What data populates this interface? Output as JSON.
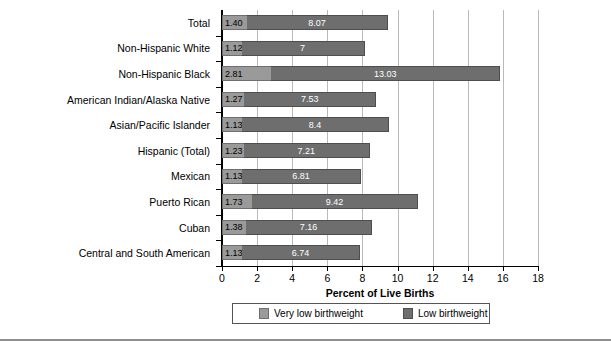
{
  "chart_data": {
    "type": "bar",
    "orientation": "horizontal",
    "stacked": true,
    "title": "",
    "xlabel": "Percent of Live Births",
    "ylabel": "",
    "xlim": [
      0,
      18
    ],
    "xticks": [
      0,
      2,
      4,
      6,
      8,
      10,
      12,
      14,
      16,
      18
    ],
    "grid": "vertical",
    "legend_position": "bottom",
    "categories": [
      "Total",
      "Non-Hispanic White",
      "Non-Hispanic Black",
      "American Indian/Alaska Native",
      "Asian/Pacific Islander",
      "Hispanic (Total)",
      "Mexican",
      "Puerto Rican",
      "Cuban",
      "Central and South American"
    ],
    "series": [
      {
        "name": "Very low birthweight",
        "color": "#9a9a9a",
        "values": [
          1.4,
          1.12,
          2.81,
          1.27,
          1.13,
          1.23,
          1.13,
          1.73,
          1.38,
          1.13
        ],
        "labels": [
          "1.40",
          "1.12",
          "2.81",
          "1.27",
          "1.13",
          "1.23",
          "1.13",
          "1.73",
          "1.38",
          "1.13"
        ]
      },
      {
        "name": "Low birthweight",
        "color": "#6e6e6e",
        "values": [
          8.07,
          7,
          13.03,
          7.53,
          8.4,
          7.21,
          6.81,
          9.42,
          7.16,
          6.74
        ],
        "labels": [
          "8.07",
          "7",
          "13.03",
          "7.53",
          "8.4",
          "7.21",
          "6.81",
          "9.42",
          "7.16",
          "6.74"
        ]
      }
    ],
    "totals": [
      9.47,
      8.12,
      15.84,
      8.8,
      9.53,
      8.44,
      7.94,
      11.15,
      8.54,
      7.87
    ]
  },
  "legend": {
    "items": [
      {
        "label": "Very low birthweight"
      },
      {
        "label": "Low birthweight"
      }
    ]
  },
  "axis": {
    "x_title": "Percent of Live Births",
    "tick_labels": [
      "0",
      "2",
      "4",
      "6",
      "8",
      "10",
      "12",
      "14",
      "16",
      "18"
    ]
  }
}
